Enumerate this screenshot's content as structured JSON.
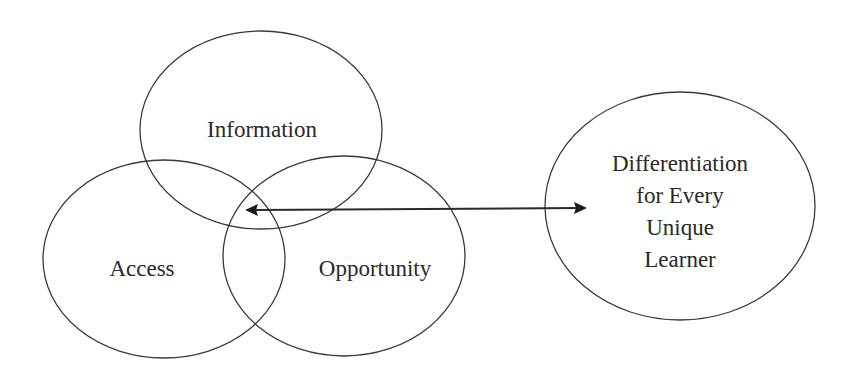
{
  "diagram": {
    "type": "venn-with-link",
    "circles": [
      {
        "id": "information",
        "label": "Information"
      },
      {
        "id": "access",
        "label": "Access"
      },
      {
        "id": "opportunity",
        "label": "Opportunity"
      }
    ],
    "target": {
      "id": "differentiation",
      "lines": [
        "Differentiation",
        "for Every",
        "Unique",
        "Learner"
      ]
    },
    "connector": {
      "from": "information-access-opportunity-intersection",
      "to": "differentiation",
      "direction": "bidirectional"
    },
    "colors": {
      "stroke": "#3a3a3a",
      "text": "#2a2a2a",
      "background": "#ffffff"
    }
  }
}
